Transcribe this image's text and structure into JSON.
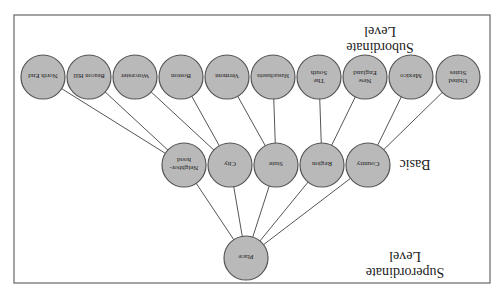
{
  "diagram": {
    "orientation": "rotated-180",
    "levels": {
      "subordinate": {
        "label_line1": "Subordinate",
        "label_line2": "Level"
      },
      "basic": {
        "label_line1": "Basic"
      },
      "superordinate": {
        "label_line1": "Superordinate",
        "label_line2": "Level"
      }
    },
    "superordinate_nodes": [
      {
        "id": "place",
        "label": "Place"
      }
    ],
    "basic_nodes": [
      {
        "id": "neighborhood",
        "line1": "Neighbor-",
        "line2": "hood"
      },
      {
        "id": "city",
        "line1": "City"
      },
      {
        "id": "state",
        "line1": "State"
      },
      {
        "id": "region",
        "line1": "Region"
      },
      {
        "id": "country",
        "line1": "Country"
      }
    ],
    "subordinate_nodes": [
      {
        "id": "north-end",
        "line1": "North End",
        "parent": "neighborhood"
      },
      {
        "id": "beacon-hill",
        "line1": "Beacon Hill",
        "parent": "neighborhood"
      },
      {
        "id": "worcester",
        "line1": "Worcester",
        "parent": "city"
      },
      {
        "id": "boston",
        "line1": "Boston",
        "parent": "city"
      },
      {
        "id": "vermont",
        "line1": "Vermont",
        "parent": "state"
      },
      {
        "id": "massachusetts",
        "line1": "Massachusetts",
        "parent": "state"
      },
      {
        "id": "the-south",
        "line1": "The",
        "line2": "South",
        "parent": "region"
      },
      {
        "id": "new-england",
        "line1": "New",
        "line2": "England",
        "parent": "region"
      },
      {
        "id": "mexico",
        "line1": "Mexico",
        "parent": "country"
      },
      {
        "id": "united-states",
        "line1": "United",
        "line2": "States",
        "parent": "country"
      }
    ],
    "colors": {
      "node_fill": "#b9b9b9",
      "node_stroke": "#555555",
      "edge": "#555555",
      "frame": "#666666"
    }
  }
}
